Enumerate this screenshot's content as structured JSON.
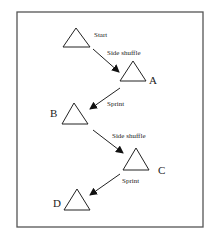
{
  "diagram": {
    "title": "",
    "stations": [
      {
        "id": "start",
        "label": "Start"
      },
      {
        "id": "a",
        "label": "A"
      },
      {
        "id": "b",
        "label": "B"
      },
      {
        "id": "c",
        "label": "C"
      },
      {
        "id": "d",
        "label": "D"
      }
    ],
    "movements": [
      {
        "from": "start",
        "to": "a",
        "label": "Side shuffle"
      },
      {
        "from": "a",
        "to": "b",
        "label": "Sprint"
      },
      {
        "from": "b",
        "to": "c",
        "label": "Side shuffle"
      },
      {
        "from": "c",
        "to": "d",
        "label": "Sprint"
      }
    ]
  }
}
